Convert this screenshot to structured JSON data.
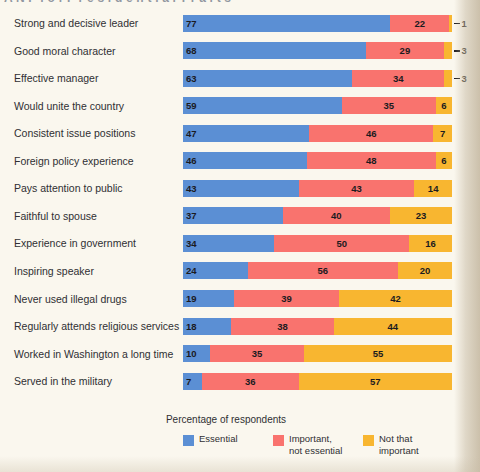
{
  "page": {
    "title_partial": "A N P  f o r  P r e s i d e n t i a l  T r a i t s",
    "background_color": "#faf7ee",
    "margin_color": "#c9bda7"
  },
  "chart_data": {
    "type": "bar",
    "orientation": "horizontal",
    "stacked": true,
    "title": "",
    "xlabel": "Percentage of respondents",
    "ylabel": "",
    "xlim": [
      0,
      100
    ],
    "grid": false,
    "legend_position": "bottom",
    "categories": [
      "Strong and decisive leader",
      "Good moral character",
      "Effective manager",
      "Would unite the country",
      "Consistent issue positions",
      "Foreign policy experience",
      "Pays attention to public",
      "Faithful to spouse",
      "Experience in government",
      "Inspiring speaker",
      "Never used illegal drugs",
      "Regularly attends religious services",
      "Worked in Washington a long time",
      "Served in the military"
    ],
    "series": [
      {
        "name": "Essential",
        "color": "#5b8fd4",
        "values": [
          77,
          68,
          63,
          59,
          47,
          46,
          43,
          37,
          34,
          24,
          19,
          18,
          10,
          7
        ]
      },
      {
        "name": "Important, not essential",
        "color": "#f9736e",
        "values": [
          22,
          29,
          34,
          35,
          46,
          48,
          43,
          40,
          50,
          56,
          39,
          38,
          35,
          36
        ]
      },
      {
        "name": "Not that important",
        "color": "#f8b630",
        "values": [
          1,
          3,
          3,
          6,
          7,
          6,
          14,
          23,
          16,
          20,
          42,
          44,
          55,
          57
        ]
      }
    ],
    "rows": [
      {
        "category": "Strong and decisive leader",
        "essential": 77,
        "important": 22,
        "notthat": 1,
        "notthat_outside": true
      },
      {
        "category": "Good moral character",
        "essential": 68,
        "important": 29,
        "notthat": 3,
        "notthat_outside": true
      },
      {
        "category": "Effective manager",
        "essential": 63,
        "important": 34,
        "notthat": 3,
        "notthat_outside": true
      },
      {
        "category": "Would unite the country",
        "essential": 59,
        "important": 35,
        "notthat": 6,
        "notthat_outside": false
      },
      {
        "category": "Consistent issue positions",
        "essential": 47,
        "important": 46,
        "notthat": 7,
        "notthat_outside": false
      },
      {
        "category": "Foreign policy experience",
        "essential": 46,
        "important": 48,
        "notthat": 6,
        "notthat_outside": false
      },
      {
        "category": "Pays attention to public",
        "essential": 43,
        "important": 43,
        "notthat": 14,
        "notthat_outside": false
      },
      {
        "category": "Faithful to spouse",
        "essential": 37,
        "important": 40,
        "notthat": 23,
        "notthat_outside": false
      },
      {
        "category": "Experience in government",
        "essential": 34,
        "important": 50,
        "notthat": 16,
        "notthat_outside": false
      },
      {
        "category": "Inspiring speaker",
        "essential": 24,
        "important": 56,
        "notthat": 20,
        "notthat_outside": false
      },
      {
        "category": "Never used illegal drugs",
        "essential": 19,
        "important": 39,
        "notthat": 42,
        "notthat_outside": false
      },
      {
        "category": "Regularly attends religious services",
        "essential": 18,
        "important": 38,
        "notthat": 44,
        "notthat_outside": false
      },
      {
        "category": "Worked in Washington a long time",
        "essential": 10,
        "important": 35,
        "notthat": 55,
        "notthat_outside": false
      },
      {
        "category": "Served in the military",
        "essential": 7,
        "important": 36,
        "notthat": 57,
        "notthat_outside": false
      }
    ]
  },
  "axis": {
    "caption": "Percentage of respondents"
  },
  "legend": {
    "items": [
      {
        "label_line1": "Essential",
        "label_line2": "",
        "color": "#5b8fd4",
        "swatch_name": "legend-swatch-essential"
      },
      {
        "label_line1": "Important,",
        "label_line2": "not essential",
        "color": "#f9736e",
        "swatch_name": "legend-swatch-important"
      },
      {
        "label_line1": "Not that",
        "label_line2": "important",
        "color": "#f8b630",
        "swatch_name": "legend-swatch-notthat"
      }
    ]
  }
}
